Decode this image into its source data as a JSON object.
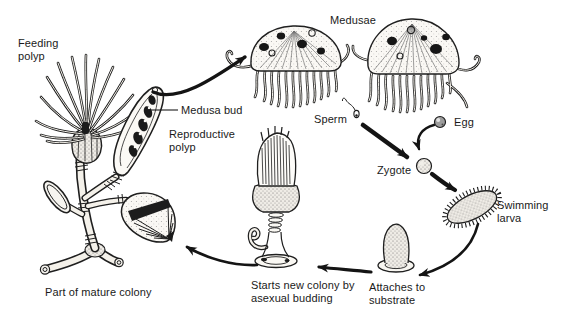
{
  "diagram": {
    "background_color": "#ffffff",
    "ink_color": "#1a1a1a",
    "labels": {
      "feeding_polyp": {
        "line1": "Feeding",
        "line2": "polyp"
      },
      "medusa_bud": "Medusa bud",
      "reproductive_polyp": {
        "line1": "Reproductive",
        "line2": "polyp"
      },
      "medusae": "Medusae",
      "sperm": "Sperm",
      "egg": "Egg",
      "zygote": "Zygote",
      "swimming_larva": {
        "line1": "Swimming",
        "line2": "larva"
      },
      "attaches_to_substrate": {
        "line1": "Attaches to",
        "line2": "substrate"
      },
      "starts_new_colony": {
        "line1": "Starts new colony by",
        "line2": "asexual budding"
      },
      "part_of_mature_colony": "Part of mature colony"
    },
    "arrows": [
      {
        "from": "medusa bud / reproductive polyp",
        "to": "medusae"
      },
      {
        "from": "sperm",
        "to": "zygote"
      },
      {
        "from": "egg",
        "to": "zygote"
      },
      {
        "from": "zygote",
        "to": "swimming larva"
      },
      {
        "from": "swimming larva",
        "to": "attaches to substrate"
      },
      {
        "from": "attaches to substrate",
        "to": "starts new colony by asexual budding"
      },
      {
        "from": "starts new colony by asexual budding",
        "to": "part of mature colony"
      }
    ]
  }
}
